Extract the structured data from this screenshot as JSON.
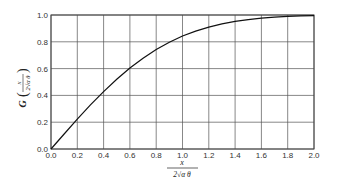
{
  "chart_data": {
    "type": "line",
    "title": "",
    "xlabel": "x / 2√(αθ)",
    "ylabel": "G(x / 2√(αθ))",
    "xlim": [
      0.0,
      2.0
    ],
    "ylim": [
      0.0,
      1.0
    ],
    "grid": true,
    "legend": null,
    "x_ticks": [
      "0.0",
      "0.2",
      "0.4",
      "0.6",
      "0.8",
      "1.0",
      "1.2",
      "1.4",
      "1.6",
      "1.8",
      "2.0"
    ],
    "y_ticks": [
      "0.0",
      "0.2",
      "0.4",
      "0.6",
      "0.8",
      "1.0"
    ],
    "series": [
      {
        "name": "G (Gauss error function)",
        "x": [
          0.0,
          0.1,
          0.2,
          0.3,
          0.4,
          0.5,
          0.6,
          0.7,
          0.8,
          0.9,
          1.0,
          1.1,
          1.2,
          1.3,
          1.4,
          1.5,
          1.6,
          1.7,
          1.8,
          1.9,
          2.0
        ],
        "values": [
          0.0,
          0.112,
          0.223,
          0.329,
          0.428,
          0.52,
          0.604,
          0.678,
          0.742,
          0.797,
          0.843,
          0.88,
          0.91,
          0.934,
          0.952,
          0.966,
          0.976,
          0.984,
          0.989,
          0.993,
          0.995
        ]
      }
    ]
  },
  "axis_labels": {
    "y_prefix": "G",
    "frac_num": "x",
    "frac_den": "2√α θ"
  }
}
